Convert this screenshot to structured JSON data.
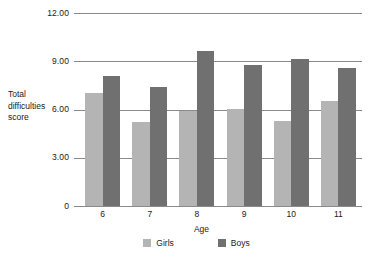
{
  "chart_data": {
    "type": "bar",
    "title": "",
    "subtitle": "",
    "xlabel": "Age",
    "ylabel": "Total difficulties score",
    "categories": [
      "6",
      "7",
      "8",
      "9",
      "10",
      "11"
    ],
    "series": [
      {
        "name": "Girls",
        "color": "#b4b4b4",
        "values": [
          7.0,
          5.2,
          5.9,
          6.05,
          5.3,
          6.5
        ]
      },
      {
        "name": "Boys",
        "color": "#707070",
        "values": [
          8.1,
          7.4,
          9.65,
          8.75,
          9.15,
          8.6
        ]
      }
    ],
    "ylim": [
      0,
      12
    ],
    "ytick_labels": [
      "12.00",
      "9.00",
      "6.00",
      "3.00",
      "0"
    ],
    "ytick_values": [
      12,
      9,
      6,
      3,
      0
    ],
    "grid": true,
    "legend_position": "bottom",
    "background_color": "#ffffff",
    "axis_color": "#8a8a8a"
  },
  "axis": {
    "y_title_lines": [
      "Total",
      "difficulties",
      "score"
    ],
    "y_title": "Total difficulties score",
    "x_title": "Age"
  },
  "legend": {
    "entries": [
      {
        "label": "Girls",
        "swatch": "girls-swatch"
      },
      {
        "label": "Boys",
        "swatch": "boys-swatch"
      }
    ]
  }
}
